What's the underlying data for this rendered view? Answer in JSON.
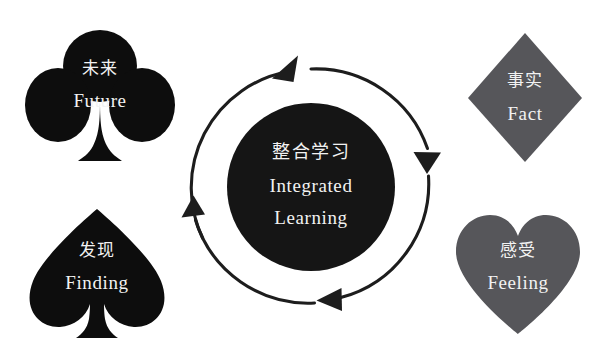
{
  "diagram": {
    "title_cn": "整合学习",
    "title_en_line1": "Integrated",
    "title_en_line2": "Learning",
    "background_color": "#ffffff",
    "core": {
      "fill": "#151515",
      "label_color": "#f2f2f2"
    },
    "cycle": {
      "arrow_color": "#1d1d1d",
      "arrow_count": 3,
      "direction": "clockwise"
    },
    "nodes": [
      {
        "id": "future",
        "icon": "club-suit-icon",
        "label_cn": "未来",
        "label_en": "Future",
        "fill": "#0d0d0d",
        "text_color": "#f5f5f5",
        "position": "top-left"
      },
      {
        "id": "fact",
        "icon": "diamond-suit-icon",
        "label_cn": "事实",
        "label_en": "Fact",
        "fill": "#56565a",
        "text_color": "#f0f0f0",
        "position": "top-right"
      },
      {
        "id": "finding",
        "icon": "spade-suit-icon",
        "label_cn": "发现",
        "label_en": "Finding",
        "fill": "#0d0d0d",
        "text_color": "#f5f5f5",
        "position": "bottom-left"
      },
      {
        "id": "feeling",
        "icon": "heart-suit-icon",
        "label_cn": "感受",
        "label_en": "Feeling",
        "fill": "#56565a",
        "text_color": "#f0f0f0",
        "position": "bottom-right"
      }
    ]
  }
}
